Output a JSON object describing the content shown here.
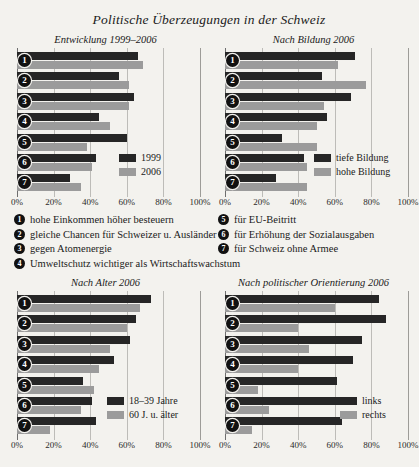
{
  "title": "Politische Überzeugungen in der Schweiz",
  "axis": {
    "ticks": [
      "0%",
      "20%",
      "40%",
      "60%",
      "80%",
      "100%"
    ],
    "values": [
      0,
      20,
      40,
      60,
      80,
      100
    ]
  },
  "colors": {
    "dark": "#262626",
    "light": "#9b9b9b",
    "background": "#f3f2ee",
    "grid": "#bdbcb8"
  },
  "key": {
    "left": [
      {
        "n": "1",
        "text": "hohe Einkommen höher besteuern"
      },
      {
        "n": "2",
        "text": "gleiche Chancen für Schweizer u. Ausländer"
      },
      {
        "n": "3",
        "text": "gegen Atomenergie"
      },
      {
        "n": "4",
        "text": "Umweltschutz wichtiger als Wirtschaftswachstum"
      }
    ],
    "right": [
      {
        "n": "5",
        "text": "für EU-Beitritt"
      },
      {
        "n": "6",
        "text": "für Erhöhung der Sozialausgaben"
      },
      {
        "n": "7",
        "text": "für Schweiz ohne Armee"
      }
    ]
  },
  "chart_data": [
    {
      "id": "entwicklung",
      "type": "bar",
      "orientation": "horizontal",
      "title": "Entwicklung 1999–2006",
      "xlabel": "",
      "ylabel": "",
      "xlim": [
        0,
        100
      ],
      "grid": true,
      "legend_position": "inside-bottom-right",
      "categories": [
        "1",
        "2",
        "3",
        "4",
        "5",
        "6",
        "7"
      ],
      "series": [
        {
          "name": "1999",
          "color": "#262626",
          "values": [
            66,
            56,
            64,
            45,
            60,
            43,
            29
          ]
        },
        {
          "name": "2006",
          "color": "#9b9b9b",
          "values": [
            69,
            61,
            61,
            51,
            38,
            41,
            35
          ]
        }
      ]
    },
    {
      "id": "bildung",
      "type": "bar",
      "orientation": "horizontal",
      "title": "Nach Bildung 2006",
      "xlabel": "",
      "ylabel": "",
      "xlim": [
        0,
        100
      ],
      "grid": true,
      "legend_position": "inside-bottom-right",
      "categories": [
        "1",
        "2",
        "3",
        "4",
        "5",
        "6",
        "7"
      ],
      "series": [
        {
          "name": "tiefe Bildung",
          "color": "#262626",
          "values": [
            71,
            53,
            69,
            56,
            31,
            43,
            28
          ]
        },
        {
          "name": "hohe Bildung",
          "color": "#9b9b9b",
          "values": [
            62,
            77,
            54,
            50,
            50,
            45,
            45
          ]
        }
      ]
    },
    {
      "id": "alter",
      "type": "bar",
      "orientation": "horizontal",
      "title": "Nach Alter 2006",
      "xlabel": "",
      "ylabel": "",
      "xlim": [
        0,
        100
      ],
      "grid": true,
      "legend_position": "inside-bottom-right",
      "categories": [
        "1",
        "2",
        "3",
        "4",
        "5",
        "6",
        "7"
      ],
      "series": [
        {
          "name": "18–39 Jahre",
          "color": "#262626",
          "values": [
            73,
            65,
            62,
            53,
            36,
            41,
            43
          ]
        },
        {
          "name": "60 J. u. älter",
          "color": "#9b9b9b",
          "values": [
            67,
            60,
            51,
            45,
            42,
            35,
            18
          ]
        }
      ]
    },
    {
      "id": "orientierung",
      "type": "bar",
      "orientation": "horizontal",
      "title": "Nach politischer Orientierung 2006",
      "xlabel": "",
      "ylabel": "",
      "xlim": [
        0,
        100
      ],
      "grid": true,
      "legend_position": "inside-bottom-right",
      "categories": [
        "1",
        "2",
        "3",
        "4",
        "5",
        "6",
        "7"
      ],
      "series": [
        {
          "name": "links",
          "color": "#262626",
          "values": [
            84,
            88,
            75,
            70,
            61,
            66,
            64
          ]
        },
        {
          "name": "rechts",
          "color": "#9b9b9b",
          "values": [
            60,
            40,
            46,
            40,
            18,
            24,
            15
          ]
        }
      ]
    }
  ]
}
